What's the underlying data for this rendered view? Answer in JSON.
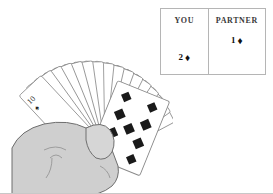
{
  "scene": {
    "title": "Card game hand illustration",
    "description": "A fan of playing cards held in a hand, with a score table"
  },
  "score_panel": {
    "columns": [
      {
        "key": "you",
        "header": "YOU",
        "count": "2",
        "suit_glyph": "♦",
        "suit_name": "diamond",
        "value_text": "2 ♦"
      },
      {
        "key": "partner",
        "header": "PARTNER",
        "count": "1",
        "suit_glyph": "♦",
        "suit_name": "diamond",
        "value_text": "1 ♦"
      }
    ]
  },
  "hand": {
    "card_count": 13,
    "cards": [
      {
        "rank": "10",
        "suit_glyph": "♠",
        "suit_name": "spade"
      },
      {
        "rank": "9",
        "suit_glyph": "♣",
        "suit_name": "club"
      },
      {
        "rank": "8",
        "suit_glyph": "♣",
        "suit_name": "club"
      },
      {
        "rank": "5",
        "suit_glyph": "♣",
        "suit_name": "club"
      },
      {
        "rank": "4",
        "suit_glyph": "♣",
        "suit_name": "club"
      },
      {
        "rank": "J",
        "suit_glyph": "♠",
        "suit_name": "spade"
      },
      {
        "rank": "7",
        "suit_glyph": "♣",
        "suit_name": "club"
      },
      {
        "rank": "4",
        "suit_glyph": "♣",
        "suit_name": "club"
      },
      {
        "rank": "K",
        "suit_glyph": "♣",
        "suit_name": "club"
      },
      {
        "rank": "Q",
        "suit_glyph": "♣",
        "suit_name": "club"
      },
      {
        "rank": "D",
        "suit_glyph": "♦",
        "suit_name": "diamond"
      },
      {
        "rank": "Q",
        "suit_glyph": "♦",
        "suit_name": "diamond"
      },
      {
        "rank": "7",
        "suit_glyph": "♦",
        "suit_name": "diamond"
      }
    ]
  },
  "colors": {
    "panel_border": "#b5b5b5",
    "card_outline": "#8a8a8a",
    "card_face": "#ffffff",
    "hand_fill": "#cfcfcf",
    "hand_outline": "#6e6e6e",
    "pip_black": "#111111",
    "page_background": "#ffffff",
    "bottom_rule": "#c8c8c8"
  }
}
